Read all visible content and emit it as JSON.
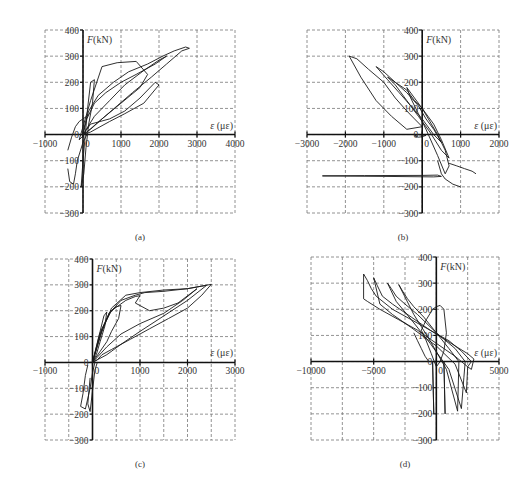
{
  "figure": {
    "captions": [
      "(a)",
      "(b)",
      "(c)",
      "(d)"
    ]
  },
  "chart_data": [
    {
      "id": "a",
      "type": "line",
      "title": "",
      "caption": "(a)",
      "xlabel": "ε (με)",
      "ylabel": "F(kN)",
      "xlim": [
        -1000,
        4000
      ],
      "ylim": [
        -300,
        400
      ],
      "xticks": [
        -1000,
        0,
        1000,
        2000,
        3000,
        4000
      ],
      "xtick_labels": [
        "-1000",
        "0",
        "1000",
        "2000",
        "3000",
        "4000"
      ],
      "xgrid": [
        -1000,
        0,
        1000,
        2000,
        3000,
        4000
      ],
      "yticks": [
        -300,
        -200,
        -100,
        0,
        100,
        200,
        300,
        400
      ],
      "ytick_labels": [
        "-300",
        "-200",
        "-100",
        "0",
        "100",
        "200",
        "300",
        "400"
      ],
      "grid": true,
      "box": {
        "x0": 45,
        "x1": 235,
        "y0": 30,
        "y1": 213
      },
      "series": [
        {
          "name": "hysteresis",
          "x": [
            0,
            50,
            150,
            400,
            800,
            1200,
            1700,
            2100,
            2400,
            2700,
            2800,
            2600,
            2200,
            1800,
            1300,
            900,
            500,
            200,
            0
          ],
          "y": [
            0,
            40,
            90,
            150,
            200,
            240,
            270,
            300,
            320,
            335,
            330,
            320,
            270,
            220,
            160,
            110,
            60,
            20,
            0
          ]
        },
        {
          "name": "loop-2",
          "x": [
            0,
            100,
            300,
            600,
            1000,
            1400,
            1900,
            2200,
            2000,
            1600,
            1100,
            700,
            300,
            0
          ],
          "y": [
            0,
            60,
            120,
            160,
            200,
            230,
            270,
            300,
            285,
            245,
            190,
            130,
            70,
            0
          ]
        },
        {
          "name": "loop-3",
          "x": [
            -100,
            0,
            200,
            500,
            900,
            1400,
            1700,
            1500,
            1000,
            500,
            100,
            -100
          ],
          "y": [
            -20,
            30,
            130,
            260,
            275,
            280,
            230,
            180,
            120,
            60,
            10,
            -20
          ]
        },
        {
          "name": "loop-4",
          "x": [
            0,
            200,
            700,
            1100,
            1500,
            1900,
            2000,
            1600,
            1100,
            700,
            200,
            0
          ],
          "y": [
            0,
            40,
            60,
            90,
            140,
            200,
            190,
            120,
            80,
            50,
            10,
            0
          ]
        },
        {
          "name": "elastic-bundle",
          "x": [
            -50,
            0,
            60,
            120,
            200,
            300,
            250,
            150,
            80,
            20,
            -50
          ],
          "y": [
            -200,
            -100,
            0,
            100,
            200,
            210,
            120,
            40,
            -50,
            -150,
            -200
          ]
        },
        {
          "name": "neg-branch",
          "x": [
            -400,
            -350,
            -250,
            -200,
            -150,
            0,
            100
          ],
          "y": [
            -130,
            -180,
            -190,
            -150,
            -100,
            -30,
            0
          ]
        },
        {
          "name": "neg-branch-2",
          "x": [
            -400,
            -300,
            -200,
            -100,
            0,
            100,
            150
          ],
          "y": [
            -60,
            -10,
            30,
            50,
            60,
            70,
            80
          ]
        }
      ],
      "peak": {
        "x": 2800,
        "y": 335
      },
      "min": {
        "x": -350,
        "y": -195
      }
    },
    {
      "id": "b",
      "type": "line",
      "caption": "(b)",
      "xlabel": "ε (με)",
      "ylabel": "F(kN)",
      "xlim": [
        -3000,
        2000
      ],
      "ylim": [
        -300,
        400
      ],
      "xticks": [
        -3000,
        -2000,
        -1000,
        0,
        1000,
        2000
      ],
      "xtick_labels": [
        "-3000",
        "-2000",
        "-1000",
        "0",
        "1000",
        "2000"
      ],
      "xgrid": [
        -3000,
        -2000,
        -1000,
        0,
        1000,
        2000
      ],
      "yticks": [
        -300,
        -200,
        -100,
        0,
        100,
        200,
        300,
        400
      ],
      "ytick_labels": [
        "-300",
        "-200",
        "-100",
        "0",
        "100",
        "200",
        "300",
        "400"
      ],
      "grid": true,
      "box": {
        "x0": 307,
        "x1": 499,
        "y0": 30,
        "y1": 213
      },
      "series": [
        {
          "name": "outer-loop",
          "x": [
            -1900,
            -1700,
            -1400,
            -1000,
            -700,
            -400,
            -200,
            0,
            -400,
            -800,
            -1200,
            -1600,
            -1900
          ],
          "y": [
            300,
            290,
            250,
            200,
            140,
            90,
            60,
            30,
            20,
            70,
            130,
            220,
            300
          ]
        },
        {
          "name": "loop-2",
          "x": [
            -1200,
            -1000,
            -700,
            -400,
            -100,
            100,
            300,
            500,
            300,
            0,
            -300,
            -600,
            -900,
            -1200
          ],
          "y": [
            260,
            240,
            200,
            160,
            110,
            60,
            20,
            -30,
            0,
            60,
            110,
            160,
            210,
            260
          ]
        },
        {
          "name": "loop-3",
          "x": [
            -900,
            -700,
            -400,
            -200,
            0,
            300,
            500,
            700,
            500,
            200,
            -100,
            -400,
            -700,
            -900
          ],
          "y": [
            220,
            200,
            170,
            130,
            100,
            40,
            -20,
            -90,
            -60,
            10,
            70,
            130,
            190,
            220
          ]
        },
        {
          "name": "bundle",
          "x": [
            -400,
            -200,
            0,
            200,
            400,
            600,
            700,
            600,
            400,
            100,
            -100,
            -300,
            -400
          ],
          "y": [
            180,
            140,
            100,
            50,
            0,
            -60,
            -120,
            -150,
            -80,
            20,
            80,
            140,
            180
          ]
        },
        {
          "name": "negative-tail",
          "x": [
            400,
            500,
            600,
            800,
            1000
          ],
          "y": [
            -100,
            -150,
            -170,
            -190,
            -200
          ]
        },
        {
          "name": "right-tail",
          "x": [
            700,
            900,
            1100,
            1300,
            1400
          ],
          "y": [
            -110,
            -120,
            -130,
            -140,
            -150
          ]
        },
        {
          "name": "horizontal-spike",
          "x": [
            -2600,
            -1500,
            0,
            400,
            500,
            300,
            -1000,
            -2600
          ],
          "y": [
            -158,
            -157,
            -156,
            -155,
            -160,
            -162,
            -160,
            -158
          ]
        },
        {
          "name": "small-loop",
          "x": [
            -100,
            -200,
            -100,
            0,
            100,
            -100
          ],
          "y": [
            0,
            -5,
            -10,
            -8,
            -3,
            0
          ]
        }
      ],
      "peak": {
        "x": -1900,
        "y": 300
      },
      "min": {
        "x": 1000,
        "y": -200
      }
    },
    {
      "id": "c",
      "type": "line",
      "caption": "(c)",
      "xlabel": "ε (με)",
      "ylabel": "F(kN)",
      "xlim": [
        -1000,
        3000
      ],
      "ylim": [
        -300,
        400
      ],
      "xticks": [
        -1000,
        0,
        1000,
        2000,
        3000
      ],
      "xtick_labels": [
        "-1000",
        "0",
        "1000",
        "2000",
        "3000"
      ],
      "xgrid": [
        -1000,
        -500,
        0,
        500,
        1000,
        1500,
        2000,
        2500,
        3000
      ],
      "yticks": [
        -300,
        -200,
        -100,
        0,
        100,
        200,
        300,
        400
      ],
      "ytick_labels": [
        "-300",
        "-200",
        "-100",
        "0",
        "100",
        "200",
        "300",
        "400"
      ],
      "grid": true,
      "box": {
        "x0": 45,
        "x1": 235,
        "y0": 259,
        "y1": 440
      },
      "series": [
        {
          "name": "outer-loop",
          "x": [
            0,
            200,
            400,
            700,
            1000,
            1500,
            2000,
            2300,
            2500,
            2300,
            2000,
            1600,
            1200,
            800,
            400,
            200,
            100,
            0
          ],
          "y": [
            0,
            120,
            210,
            260,
            270,
            280,
            285,
            295,
            302,
            260,
            210,
            170,
            130,
            90,
            50,
            30,
            10,
            0
          ]
        },
        {
          "name": "loop-2",
          "x": [
            0,
            150,
            350,
            600,
            900,
            1100,
            1500,
            2000,
            2300,
            2400,
            2000,
            1500,
            1000,
            600,
            300,
            100,
            0
          ],
          "y": [
            0,
            100,
            190,
            240,
            260,
            270,
            275,
            285,
            295,
            298,
            240,
            180,
            120,
            70,
            30,
            10,
            0
          ]
        },
        {
          "name": "loop-3",
          "x": [
            0,
            200,
            400,
            700,
            900,
            1000,
            900,
            1200,
            1500,
            1800,
            2200,
            1900,
            1500,
            1000,
            600,
            300,
            0
          ],
          "y": [
            0,
            130,
            200,
            240,
            255,
            258,
            230,
            200,
            210,
            230,
            285,
            240,
            190,
            150,
            110,
            60,
            0
          ]
        },
        {
          "name": "loop-4",
          "x": [
            0,
            150,
            350,
            500,
            600,
            550,
            400,
            300,
            150,
            0
          ],
          "y": [
            0,
            110,
            190,
            215,
            220,
            170,
            120,
            80,
            40,
            0
          ]
        },
        {
          "name": "elastic-bundle",
          "x": [
            0,
            80,
            160,
            240,
            300,
            260,
            160,
            80,
            0
          ],
          "y": [
            0,
            60,
            120,
            180,
            195,
            140,
            80,
            30,
            0
          ]
        },
        {
          "name": "neg-branch",
          "x": [
            -100,
            -150,
            -200,
            -250,
            -150,
            -50,
            0,
            50
          ],
          "y": [
            -10,
            -50,
            -120,
            -170,
            -180,
            -100,
            -40,
            0
          ]
        },
        {
          "name": "neg-branch-2",
          "x": [
            -50,
            -100,
            -50,
            0,
            50,
            100
          ],
          "y": [
            -60,
            -160,
            -190,
            -110,
            -30,
            0
          ]
        }
      ],
      "peak": {
        "x": 2500,
        "y": 302
      },
      "min": {
        "x": -250,
        "y": -185
      }
    },
    {
      "id": "d",
      "type": "line",
      "caption": "(d)",
      "xlabel": "ε (με)",
      "ylabel": "F(kN)",
      "xlim": [
        -10000,
        5000
      ],
      "ylim": [
        -300,
        400
      ],
      "xticks": [
        -10000,
        -5000,
        0,
        5000
      ],
      "xtick_labels": [
        "-10000",
        "-5000",
        "0",
        "5000"
      ],
      "xgrid": [
        -10000,
        -7500,
        -5000,
        -2500,
        0,
        2500,
        5000
      ],
      "yticks": [
        -300,
        -200,
        -100,
        0,
        100,
        200,
        300,
        400
      ],
      "ytick_labels": [
        "-300",
        "-200",
        "-100",
        "0",
        "100",
        "200",
        "300",
        "400"
      ],
      "grid": true,
      "box": {
        "x0": 311,
        "x1": 499,
        "y0": 257,
        "y1": 440
      },
      "series": [
        {
          "name": "loop-1",
          "x": [
            -5800,
            -5500,
            -5200,
            -4800,
            -3500,
            -2000,
            -500,
            500,
            1500,
            2500,
            3000,
            2800,
            2500,
            1500,
            0,
            -1500,
            -3000,
            -4500,
            -5500,
            -5800,
            -5800
          ],
          "y": [
            335,
            310,
            280,
            250,
            200,
            160,
            120,
            90,
            60,
            30,
            10,
            -30,
            -20,
            20,
            70,
            120,
            160,
            200,
            230,
            240,
            335
          ]
        },
        {
          "name": "loop-2",
          "x": [
            -5000,
            -4700,
            -4300,
            -3500,
            -2000,
            -500,
            1000,
            2000,
            2800,
            2500,
            2400,
            1500,
            0,
            -2000,
            -3500,
            -4500,
            -5000
          ],
          "y": [
            320,
            290,
            250,
            220,
            170,
            120,
            80,
            40,
            0,
            -20,
            -120,
            -10,
            60,
            130,
            180,
            220,
            320
          ]
        },
        {
          "name": "loop-3",
          "x": [
            -3900,
            -3600,
            -3200,
            -2500,
            -1500,
            0,
            1500,
            2300,
            2200,
            2000,
            1000,
            -500,
            -2000,
            -3200,
            -3900
          ],
          "y": [
            300,
            280,
            250,
            220,
            180,
            110,
            50,
            0,
            -60,
            -180,
            -30,
            70,
            160,
            230,
            300
          ]
        },
        {
          "name": "loop-4",
          "x": [
            -3000,
            -2700,
            -2300,
            -1800,
            -1000,
            0,
            1000,
            1800,
            1700,
            800,
            -500,
            -1800,
            -3000
          ],
          "y": [
            295,
            270,
            240,
            210,
            170,
            110,
            50,
            0,
            -190,
            -30,
            80,
            180,
            295
          ]
        },
        {
          "name": "elastic-bundle",
          "x": [
            -1200,
            -800,
            -300,
            0,
            300,
            600,
            800,
            600,
            300,
            0,
            -400,
            -900,
            -1200
          ],
          "y": [
            120,
            160,
            200,
            210,
            215,
            200,
            110,
            40,
            0,
            -20,
            30,
            90,
            120
          ]
        },
        {
          "name": "vertical-spike-1",
          "x": [
            -300,
            -250,
            -200,
            -200,
            -250,
            -300
          ],
          "y": [
            0,
            -100,
            -200,
            -200,
            -100,
            0
          ]
        },
        {
          "name": "vertical-spike-2",
          "x": [
            600,
            650,
            700,
            700,
            650,
            600
          ],
          "y": [
            0,
            -100,
            -200,
            -200,
            -100,
            0
          ]
        },
        {
          "name": "left-drop",
          "x": [
            -1800,
            -1500,
            -1200,
            -900,
            -600
          ],
          "y": [
            110,
            80,
            50,
            20,
            0
          ]
        }
      ],
      "peak": {
        "x": -5800,
        "y": 335
      },
      "min": {
        "x": 700,
        "y": -200
      }
    }
  ]
}
